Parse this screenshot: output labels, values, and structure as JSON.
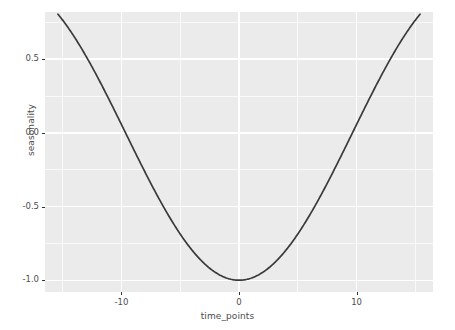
{
  "chart_data": {
    "type": "line",
    "title": "",
    "xlabel": "time_points",
    "ylabel": "seasonality",
    "xlim": [
      -16.5,
      16.5
    ],
    "ylim": [
      -1.08,
      0.82
    ],
    "grid": true,
    "legend": null,
    "line_color": "#3a3a3a",
    "panel_bg": "#ebebeb",
    "gridline_color": "#ffffff",
    "x_ticks": [
      -10,
      0,
      10
    ],
    "x_tick_labels": [
      "-10",
      "0",
      "10"
    ],
    "y_ticks": [
      0.5,
      0.0,
      -0.5,
      -1.0
    ],
    "y_tick_labels": [
      "0.5",
      "0.0",
      "-0.5",
      "-1.0"
    ],
    "x_minor_ticks": [
      -15,
      -5,
      5,
      15
    ],
    "y_minor_ticks": [
      0.75,
      0.25,
      -0.25,
      -0.75
    ],
    "series": [
      {
        "name": "seasonality",
        "x": [
          -15.4,
          -15.0,
          -14.5,
          -14.0,
          -13.5,
          -13.0,
          -12.5,
          -12.0,
          -11.5,
          -11.0,
          -10.5,
          -10.0,
          -9.5,
          -9.0,
          -8.5,
          -8.0,
          -7.5,
          -7.0,
          -6.5,
          -6.0,
          -5.5,
          -5.0,
          -4.5,
          -4.0,
          -3.5,
          -3.0,
          -2.5,
          -2.0,
          -1.5,
          -1.0,
          -0.5,
          0.0,
          0.5,
          1.0,
          1.5,
          2.0,
          2.5,
          3.0,
          3.5,
          4.0,
          4.5,
          5.0,
          5.5,
          6.0,
          6.5,
          7.0,
          7.5,
          8.0,
          8.5,
          9.0,
          9.5,
          10.0,
          10.5,
          11.0,
          11.5,
          12.0,
          12.5,
          13.0,
          13.5,
          14.0,
          14.5,
          15.0,
          15.4
        ],
        "y": [
          0.738,
          0.705,
          0.663,
          0.619,
          0.572,
          0.523,
          0.472,
          0.419,
          0.364,
          0.307,
          0.249,
          0.189,
          0.128,
          0.066,
          0.003,
          -0.06,
          -0.123,
          -0.186,
          -0.248,
          -0.31,
          -0.371,
          -0.43,
          -0.488,
          -0.544,
          -0.598,
          -0.649,
          -0.698,
          -0.744,
          -0.787,
          -0.826,
          -0.862,
          -1.0,
          -0.862,
          -0.826,
          -0.787,
          -0.744,
          -0.698,
          -0.649,
          -0.598,
          -0.544,
          -0.488,
          -0.43,
          -0.371,
          -0.31,
          -0.248,
          -0.186,
          -0.123,
          -0.06,
          0.003,
          0.066,
          0.128,
          0.189,
          0.249,
          0.307,
          0.364,
          0.419,
          0.472,
          0.523,
          0.572,
          0.619,
          0.663,
          0.705,
          0.738
        ]
      }
    ],
    "formula": "-cos(2*pi*x/38.6)",
    "min_value": -1.0,
    "min_at_x": 0,
    "zero_crossings": [
      -9.65,
      9.65
    ]
  },
  "axes": {
    "y_title": "seasonality",
    "x_title": "time_points",
    "y_tick_labels": [
      "0.5",
      "0.0",
      "-0.5",
      "-1.0"
    ],
    "x_tick_labels": [
      "-10",
      "0",
      "10"
    ]
  }
}
